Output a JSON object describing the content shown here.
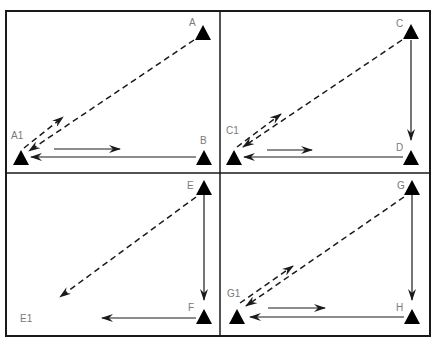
{
  "diagram": {
    "type": "drill-diagram",
    "colors": {
      "line": "#1a1a1a",
      "frame": "#1a1a1a",
      "label": "#7a7a7a",
      "background": "#ffffff"
    },
    "panels": [
      {
        "id": "panel-1",
        "markers": [
          {
            "label": "A",
            "x": 203,
            "y": 33,
            "lx": 189,
            "ly": 25
          },
          {
            "label": "A1",
            "x": 21,
            "y": 158,
            "lx": 11,
            "ly": 138
          },
          {
            "label": "B",
            "x": 204,
            "y": 158,
            "lx": 200,
            "ly": 143
          }
        ]
      },
      {
        "id": "panel-2",
        "markers": [
          {
            "label": "C",
            "x": 411,
            "y": 33,
            "lx": 396,
            "ly": 27
          },
          {
            "label": "C1",
            "x": 234,
            "y": 158,
            "lx": 226,
            "ly": 134
          },
          {
            "label": "D",
            "x": 411,
            "y": 158,
            "lx": 396,
            "ly": 150
          }
        ]
      },
      {
        "id": "panel-3",
        "markers": [
          {
            "label": "E",
            "x": 204,
            "y": 188,
            "lx": 187,
            "ly": 188
          },
          {
            "label": "F",
            "x": 204,
            "y": 317,
            "lx": 188,
            "ly": 310
          },
          {
            "label": "E1",
            "x": null,
            "y": null,
            "lx": 20,
            "ly": 322
          }
        ]
      },
      {
        "id": "panel-4",
        "markers": [
          {
            "label": "G",
            "x": 412,
            "y": 188,
            "lx": 397,
            "ly": 188
          },
          {
            "label": "G1",
            "x": 237,
            "y": 317,
            "lx": 227,
            "ly": 296
          },
          {
            "label": "H",
            "x": 412,
            "y": 317,
            "lx": 396,
            "ly": 310
          }
        ]
      }
    ]
  }
}
